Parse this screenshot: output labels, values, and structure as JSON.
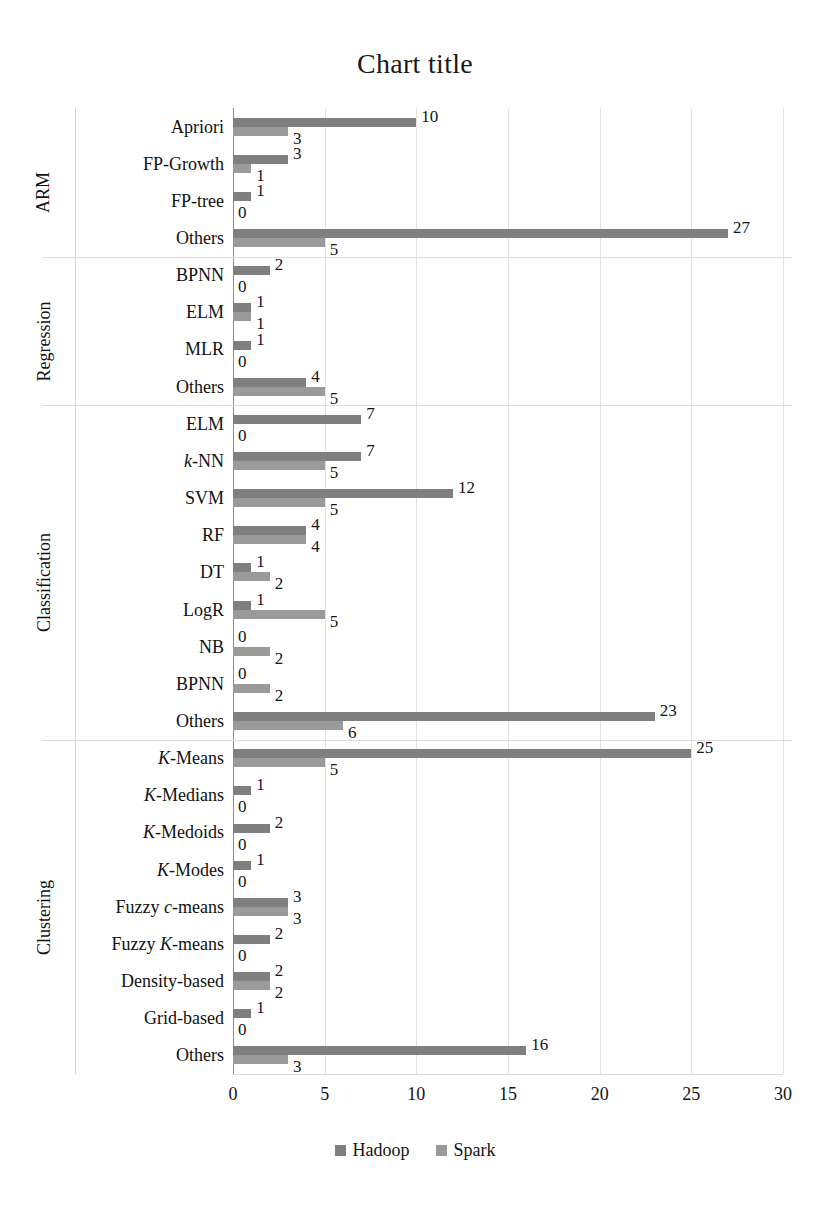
{
  "chart_data": {
    "type": "bar",
    "orientation": "horizontal",
    "title": "Chart title",
    "xlabel": "",
    "ylabel": "",
    "xlim": [
      0,
      30
    ],
    "xticks": [
      0,
      5,
      10,
      15,
      20,
      25,
      30
    ],
    "xtick_labels": [
      "0",
      "5",
      "10",
      "15",
      "20",
      "25",
      "30"
    ],
    "grid": true,
    "legend_position": "bottom",
    "colors": {
      "Hadoop": "#7f7f7f",
      "Spark": "#9a9a9a"
    },
    "series": [
      {
        "name": "Hadoop",
        "values": [
          10,
          3,
          1,
          27,
          2,
          1,
          1,
          4,
          7,
          7,
          12,
          4,
          1,
          1,
          0,
          0,
          23,
          25,
          1,
          2,
          1,
          3,
          2,
          2,
          1,
          16
        ]
      },
      {
        "name": "Spark",
        "values": [
          3,
          1,
          0,
          5,
          0,
          1,
          0,
          5,
          0,
          5,
          5,
          4,
          2,
          5,
          2,
          2,
          6,
          5,
          0,
          0,
          0,
          3,
          0,
          2,
          0,
          3
        ]
      }
    ],
    "categories": [
      "Apriori",
      "FP-Growth",
      "FP-tree",
      "Others",
      "BPNN",
      "ELM",
      "MLR",
      "Others",
      "ELM",
      "k-NN",
      "SVM",
      "RF",
      "DT",
      "LogR",
      "NB",
      "BPNN",
      "Others",
      "K-Means",
      "K-Medians",
      "K-Medoids",
      "K-Modes",
      "Fuzzy c-means",
      "Fuzzy K-means",
      "Density-based",
      "Grid-based",
      "Others"
    ],
    "category_labels_html": [
      "Apriori",
      "FP-Growth",
      "FP-tree",
      "Others",
      "BPNN",
      "ELM",
      "MLR",
      "Others",
      "ELM",
      "<i>k</i>-NN",
      "SVM",
      "RF",
      "DT",
      "LogR",
      "NB",
      "BPNN",
      "Others",
      "<i>K</i>-Means",
      "<i>K</i>-Medians",
      "<i>K</i>-Medoids",
      "<i>K</i>-Modes",
      "Fuzzy <i>c</i>-means",
      "Fuzzy <i>K</i>-means",
      "Density-based",
      "Grid-based",
      "Others"
    ],
    "groups": [
      {
        "label": "ARM",
        "start": 0,
        "count": 4
      },
      {
        "label": "Regression",
        "start": 4,
        "count": 4
      },
      {
        "label": "Classification",
        "start": 8,
        "count": 9
      },
      {
        "label": "Clustering",
        "start": 17,
        "count": 9
      }
    ]
  },
  "legend": {
    "items": [
      {
        "label": "Hadoop",
        "color": "#7f7f7f"
      },
      {
        "label": "Spark",
        "color": "#9a9a9a"
      }
    ]
  }
}
